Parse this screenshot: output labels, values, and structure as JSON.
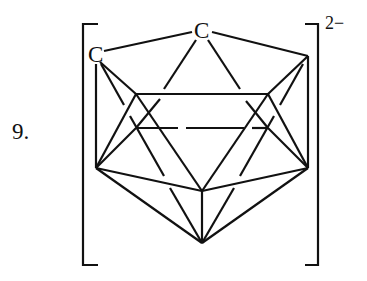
{
  "figure": {
    "item_number": "9.",
    "charge": "2−",
    "atom_labels": [
      "C",
      "C"
    ]
  },
  "colors": {
    "line": "#111111",
    "background": "#ffffff"
  }
}
